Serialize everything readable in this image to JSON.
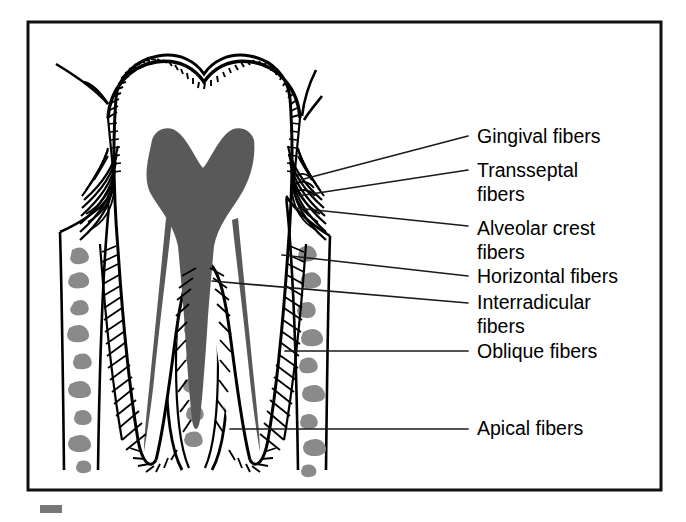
{
  "figure": {
    "frame": {
      "x": 28,
      "y": 22,
      "width": 633,
      "height": 468
    }
  },
  "colors": {
    "ink": "#000000",
    "frame": "#111111",
    "leader": "#1a1a1a",
    "pulp_gray": "#595959",
    "bone_marrow_gray": "#8a8a8a",
    "artifact_gray": "#777777",
    "background": "#ffffff"
  },
  "labels": [
    {
      "id": "gingival-fibers",
      "text": "Gingival fibers",
      "lines": [
        "Gingival fibers"
      ],
      "text_x": 477,
      "baselines": [
        143
      ],
      "leader": {
        "x1": 468,
        "y1": 136,
        "x2": 300,
        "y2": 180
      }
    },
    {
      "id": "transseptal-fibers",
      "text": "Transseptal fibers",
      "lines": [
        "Transseptal",
        "fibers"
      ],
      "text_x": 477,
      "baselines": [
        177,
        201
      ],
      "leader": {
        "x1": 468,
        "y1": 170,
        "x2": 298,
        "y2": 196
      }
    },
    {
      "id": "alveolar-crest-fibers",
      "text": "Alveolar crest fibers",
      "lines": [
        "Alveolar crest",
        "fibers"
      ],
      "text_x": 477,
      "baselines": [
        235,
        259
      ],
      "leader": {
        "x1": 468,
        "y1": 226,
        "x2": 296,
        "y2": 208
      }
    },
    {
      "id": "horizontal-fibers",
      "text": "Horizontal fibers",
      "lines": [
        "Horizontal fibers"
      ],
      "text_x": 477,
      "baselines": [
        283
      ],
      "leader": {
        "x1": 468,
        "y1": 276,
        "x2": 282,
        "y2": 255
      }
    },
    {
      "id": "interradicular-fibers",
      "text": "Interradicular fibers",
      "lines": [
        "Interradicular",
        "fibers"
      ],
      "text_x": 477,
      "baselines": [
        309,
        333
      ],
      "leader": {
        "x1": 468,
        "y1": 303,
        "x2": 212,
        "y2": 281
      }
    },
    {
      "id": "oblique-fibers",
      "text": "Oblique fibers",
      "lines": [
        "Oblique fibers"
      ],
      "text_x": 477,
      "baselines": [
        358
      ],
      "leader": {
        "x1": 468,
        "y1": 351,
        "x2": 285,
        "y2": 351
      }
    },
    {
      "id": "apical-fibers",
      "text": "Apical fibers",
      "lines": [
        "Apical fibers"
      ],
      "text_x": 477,
      "baselines": [
        435
      ],
      "leader": {
        "x1": 468,
        "y1": 429,
        "x2": 230,
        "y2": 429
      }
    }
  ],
  "artifact": {
    "x": 40,
    "y": 505,
    "width": 22,
    "height": 8
  }
}
